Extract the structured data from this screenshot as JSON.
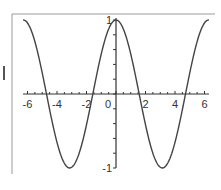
{
  "chart_data": {
    "type": "line",
    "title": "",
    "xlabel": "",
    "ylabel": "",
    "function": "cos(x)",
    "xlim": [
      -6.3,
      6.3
    ],
    "ylim": [
      -1,
      1
    ],
    "grid": false,
    "legend": null,
    "x_ticks": [
      -6,
      -4,
      -2,
      0,
      2,
      4,
      6
    ],
    "x_tick_labels": [
      "-6",
      "-4",
      "-2",
      "0",
      "2",
      "4",
      "6"
    ],
    "y_ticks": [
      -1,
      1
    ],
    "y_tick_labels": [
      "-1",
      "1"
    ],
    "series": [
      {
        "name": "cos(x)",
        "x": [
          -6.28,
          -5.5,
          -4.71,
          -3.93,
          -3.14,
          -2.36,
          -1.57,
          -0.79,
          0,
          0.79,
          1.57,
          2.36,
          3.14,
          3.93,
          4.71,
          5.5,
          6.28
        ],
        "values": [
          1,
          0.71,
          0,
          -0.71,
          -1,
          -0.71,
          0,
          0.71,
          1,
          0.71,
          0,
          -0.71,
          -1,
          -0.71,
          0,
          0.71,
          1
        ]
      }
    ],
    "colors": {
      "line": "#444444",
      "axis": "#333333",
      "frame": "#9a9a9a"
    }
  }
}
